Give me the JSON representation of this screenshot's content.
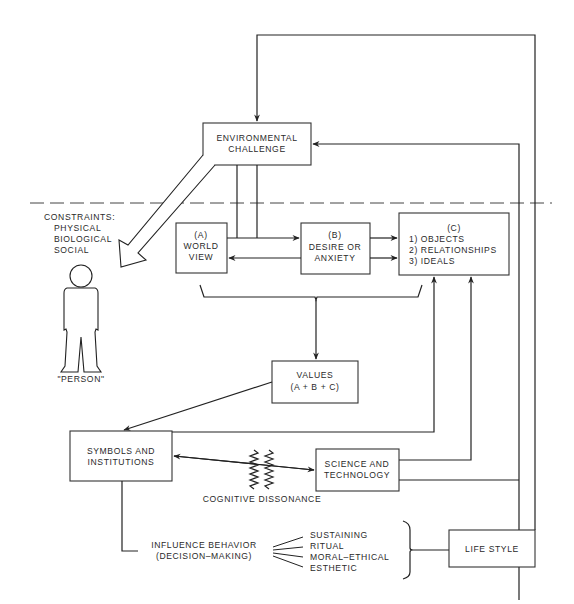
{
  "diagram": {
    "environmental_challenge": [
      "ENVIRONMENTAL",
      "CHALLENGE"
    ],
    "constraints": {
      "title": "CONSTRAINTS:",
      "items": [
        "PHYSICAL",
        "BIOLOGICAL",
        "SOCIAL"
      ]
    },
    "person_label": "\"PERSON\"",
    "box_a": [
      "(A)",
      "WORLD",
      "VIEW"
    ],
    "box_b": [
      "(B)",
      "DESIRE OR",
      "ANXIETY"
    ],
    "box_c": [
      "(C)",
      "1)  OBJECTS",
      "2)  RELATIONSHIPS",
      "3)  IDEALS"
    ],
    "values": [
      "VALUES",
      "(A + B + C)"
    ],
    "symbols": [
      "SYMBOLS AND",
      "INSTITUTIONS"
    ],
    "science": [
      "SCIENCE AND",
      "TECHNOLOGY"
    ],
    "cognitive_dissonance": "COGNITIVE DISSONANCE",
    "influence": [
      "INFLUENCE BEHAVIOR",
      "(DECISION–MAKING)"
    ],
    "influence_types": [
      "SUSTAINING",
      "RITUAL",
      "MORAL–ETHICAL",
      "ESTHETIC"
    ],
    "life_style": "LIFE STYLE"
  }
}
